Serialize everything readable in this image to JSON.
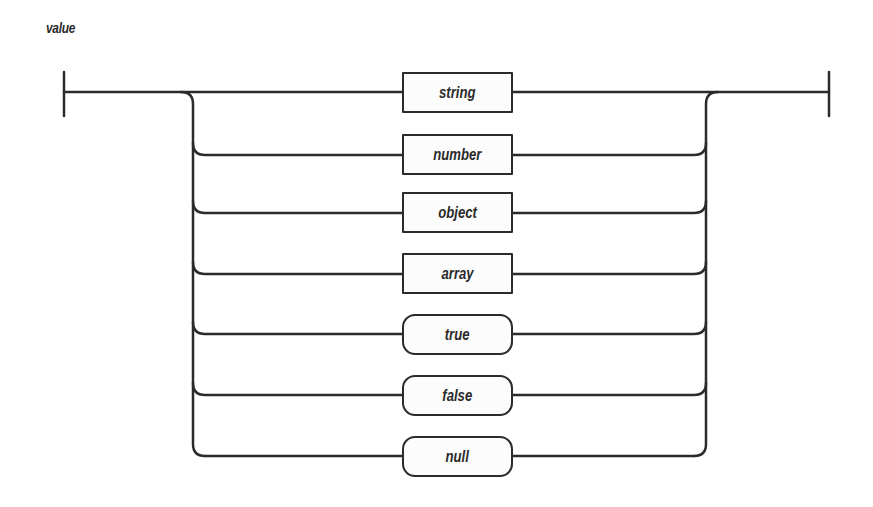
{
  "diagram": {
    "title": "value",
    "type": "railroad-syntax-diagram",
    "start_terminator": "bar",
    "end_terminator": "bar",
    "alternatives": [
      {
        "label": "string",
        "kind": "nonterminal",
        "shape": "rectangle"
      },
      {
        "label": "number",
        "kind": "nonterminal",
        "shape": "rectangle"
      },
      {
        "label": "object",
        "kind": "nonterminal",
        "shape": "rectangle"
      },
      {
        "label": "array",
        "kind": "nonterminal",
        "shape": "rectangle"
      },
      {
        "label": "true",
        "kind": "terminal",
        "shape": "rounded"
      },
      {
        "label": "false",
        "kind": "terminal",
        "shape": "rounded"
      },
      {
        "label": "null",
        "kind": "terminal",
        "shape": "rounded"
      }
    ],
    "colors": {
      "line": "#2b2b2b",
      "text": "#2a2a2a",
      "background": "#ffffff"
    }
  }
}
